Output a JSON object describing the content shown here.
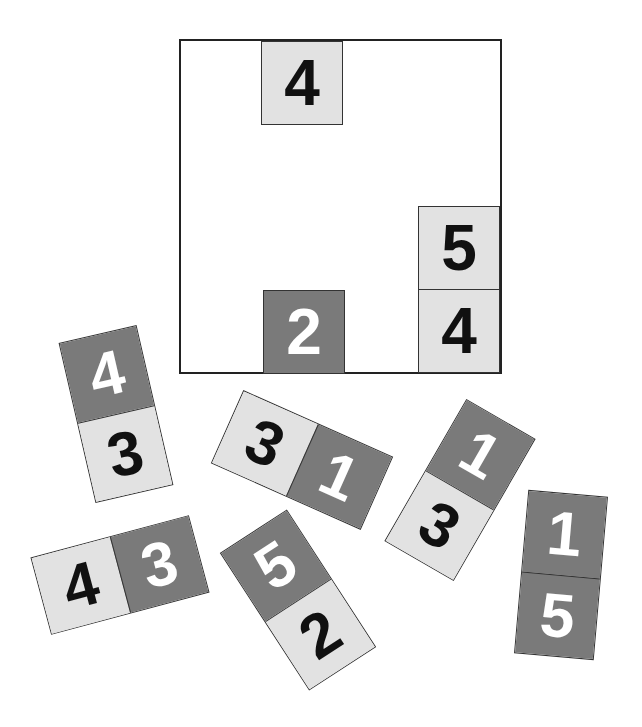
{
  "board": {
    "placed_tiles": [
      {
        "value": "4",
        "shade": "light",
        "left": 80,
        "top": 0
      },
      {
        "value": "5",
        "shade": "light",
        "left": 242,
        "top": 165
      },
      {
        "value": "4",
        "shade": "light",
        "left": 242,
        "top": 248
      },
      {
        "value": "2",
        "shade": "dark",
        "left": 82,
        "top": 249
      }
    ]
  },
  "dominoes": [
    {
      "id": "d1",
      "orientation": "vertical",
      "cx": 116,
      "cy": 414,
      "rotate": -13,
      "halves": [
        {
          "value": "4",
          "shade": "dark"
        },
        {
          "value": "3",
          "shade": "light"
        }
      ]
    },
    {
      "id": "d2",
      "orientation": "horizontal",
      "cx": 302,
      "cy": 460,
      "rotate": 24,
      "halves": [
        {
          "value": "3",
          "shade": "light"
        },
        {
          "value": "1",
          "shade": "dark"
        }
      ]
    },
    {
      "id": "d3",
      "orientation": "vertical",
      "cx": 460,
      "cy": 490,
      "rotate": 30,
      "halves": [
        {
          "value": "1",
          "shade": "dark"
        },
        {
          "value": "3",
          "shade": "light"
        }
      ]
    },
    {
      "id": "d4",
      "orientation": "vertical",
      "cx": 561,
      "cy": 575,
      "rotate": 5,
      "halves": [
        {
          "value": "1",
          "shade": "dark"
        },
        {
          "value": "5",
          "shade": "dark"
        }
      ]
    },
    {
      "id": "d5",
      "orientation": "horizontal",
      "cx": 120,
      "cy": 575,
      "rotate": -15,
      "halves": [
        {
          "value": "4",
          "shade": "light"
        },
        {
          "value": "3",
          "shade": "dark"
        }
      ]
    },
    {
      "id": "d6",
      "orientation": "vertical",
      "cx": 298,
      "cy": 600,
      "rotate": -33,
      "halves": [
        {
          "value": "5",
          "shade": "dark"
        },
        {
          "value": "2",
          "shade": "light"
        }
      ]
    }
  ],
  "colors": {
    "light_tile": "#e2e2e2",
    "dark_tile": "#7a7a7a",
    "border": "#222222"
  }
}
